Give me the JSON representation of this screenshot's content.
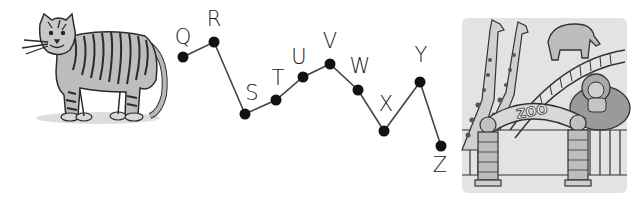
{
  "scene": {
    "left_illustration": "tiger",
    "right_illustration": "zoo-entrance",
    "zoo_sign_text": "ZOO"
  },
  "dot_path": {
    "line_color": "#444444",
    "dot_color": "#111111",
    "points": [
      {
        "letter": "Q",
        "x": 183,
        "y": 57,
        "lx": 183,
        "ly": 37
      },
      {
        "letter": "R",
        "x": 214,
        "y": 42,
        "lx": 214,
        "ly": 19
      },
      {
        "letter": "S",
        "x": 245,
        "y": 114,
        "lx": 252,
        "ly": 93
      },
      {
        "letter": "T",
        "x": 276,
        "y": 100,
        "lx": 278,
        "ly": 78
      },
      {
        "letter": "U",
        "x": 303,
        "y": 77,
        "lx": 299,
        "ly": 57
      },
      {
        "letter": "V",
        "x": 330,
        "y": 64,
        "lx": 330,
        "ly": 41
      },
      {
        "letter": "W",
        "x": 358,
        "y": 90,
        "lx": 360,
        "ly": 66
      },
      {
        "letter": "X",
        "x": 384,
        "y": 131,
        "lx": 386,
        "ly": 104
      },
      {
        "letter": "Y",
        "x": 420,
        "y": 82,
        "lx": 421,
        "ly": 55
      },
      {
        "letter": "Z",
        "x": 441,
        "y": 146,
        "lx": 440,
        "ly": 165
      }
    ]
  }
}
